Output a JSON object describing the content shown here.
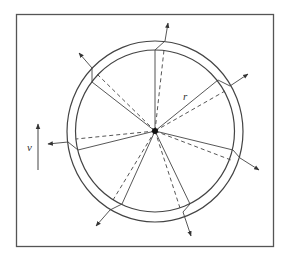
{
  "diagram": {
    "labels": {
      "radius": "r",
      "velocity": "v"
    },
    "colors": {
      "stroke": "#444444",
      "frame": "#555555",
      "background": "#ffffff"
    },
    "frame": {
      "x": 16,
      "y": 14,
      "width": 257,
      "height": 232
    },
    "wheel": {
      "center": [
        155,
        131
      ],
      "outer_radius": 89,
      "inner_radius": 80
    },
    "spokes": [
      {
        "name": "top",
        "solid_end": [
          155,
          50
        ],
        "ring_end": [
          165,
          41
        ],
        "arrow_tip": [
          168,
          23
        ],
        "dashed_end": [
          164,
          50
        ]
      },
      {
        "name": "upper-left",
        "solid_end": [
          92,
          82
        ],
        "ring_end": [
          92,
          68
        ],
        "arrow_tip": [
          79,
          53
        ],
        "dashed_end": [
          97,
          74
        ]
      },
      {
        "name": "upper-right",
        "solid_end": [
          218,
          80
        ],
        "ring_end": [
          230,
          86
        ],
        "arrow_tip": [
          248,
          74
        ],
        "dashed_end": [
          225,
          91
        ]
      },
      {
        "name": "left",
        "solid_end": [
          78,
          150
        ],
        "ring_end": [
          68,
          142
        ],
        "arrow_tip": [
          48,
          144
        ],
        "dashed_end": [
          76,
          139
        ]
      },
      {
        "name": "right",
        "solid_end": [
          233,
          150
        ],
        "ring_end": [
          240,
          158
        ],
        "arrow_tip": [
          259,
          170
        ],
        "dashed_end": [
          231,
          160
        ]
      },
      {
        "name": "lower-left",
        "solid_end": [
          122,
          204
        ],
        "ring_end": [
          110,
          210
        ],
        "arrow_tip": [
          96,
          226
        ],
        "dashed_end": [
          113,
          200
        ]
      },
      {
        "name": "lower-right",
        "solid_end": [
          190,
          204
        ],
        "ring_end": [
          183,
          212
        ],
        "arrow_tip": [
          191,
          236
        ],
        "dashed_end": [
          180,
          208
        ]
      }
    ],
    "velocity_arrow": {
      "from": [
        38,
        170
      ],
      "to": [
        38,
        124
      ]
    }
  }
}
